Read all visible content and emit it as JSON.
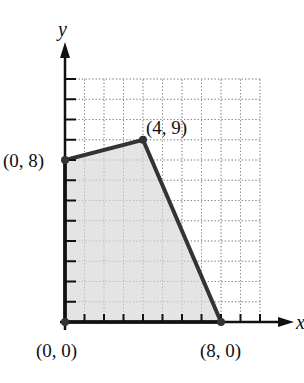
{
  "chart_data": {
    "type": "area",
    "title": "",
    "xlabel": "x",
    "ylabel": "y",
    "xlim": [
      0,
      10
    ],
    "ylim": [
      0,
      12
    ],
    "grid": true,
    "polygon": [
      [
        0,
        0
      ],
      [
        0,
        8
      ],
      [
        4,
        9
      ],
      [
        8,
        0
      ]
    ],
    "vertices": [
      {
        "x": 0,
        "y": 0,
        "label": "(0, 0)"
      },
      {
        "x": 0,
        "y": 8,
        "label": "(0, 8)"
      },
      {
        "x": 4,
        "y": 9,
        "label": "(4, 9)"
      },
      {
        "x": 8,
        "y": 0,
        "label": "(8, 0)"
      }
    ],
    "fill_color": "#e4e4e4",
    "edge_color": "#333333"
  },
  "labels": {
    "x_axis": "x",
    "y_axis": "y",
    "v00": "(0, 0)",
    "v08": "(0, 8)",
    "v49": "(4, 9)",
    "v80": "(8, 0)"
  }
}
